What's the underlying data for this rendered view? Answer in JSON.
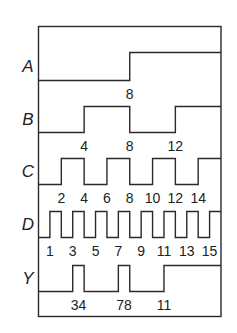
{
  "diagram": {
    "type": "timing-diagram",
    "time_range": [
      0,
      16
    ],
    "signals": [
      {
        "name": "A",
        "initial": 0,
        "transitions": [
          8
        ],
        "labels": [
          {
            "t": 8,
            "text": "8"
          }
        ]
      },
      {
        "name": "B",
        "initial": 0,
        "transitions": [
          4,
          8,
          12
        ],
        "labels": [
          {
            "t": 4,
            "text": "4"
          },
          {
            "t": 8,
            "text": "8"
          },
          {
            "t": 12,
            "text": "12"
          }
        ]
      },
      {
        "name": "C",
        "initial": 0,
        "transitions": [
          2,
          4,
          6,
          8,
          10,
          12,
          14
        ],
        "labels": [
          {
            "t": 2,
            "text": "2"
          },
          {
            "t": 4,
            "text": "4"
          },
          {
            "t": 6,
            "text": "6"
          },
          {
            "t": 8,
            "text": "8"
          },
          {
            "t": 10,
            "text": "10"
          },
          {
            "t": 12,
            "text": "12"
          },
          {
            "t": 14,
            "text": "14"
          }
        ]
      },
      {
        "name": "D",
        "initial": 0,
        "transitions": [
          1,
          2,
          3,
          4,
          5,
          6,
          7,
          8,
          9,
          10,
          11,
          12,
          13,
          14,
          15
        ],
        "labels": [
          {
            "t": 1,
            "text": "1"
          },
          {
            "t": 3,
            "text": "3"
          },
          {
            "t": 5,
            "text": "5"
          },
          {
            "t": 7,
            "text": "7"
          },
          {
            "t": 9,
            "text": "9"
          },
          {
            "t": 11,
            "text": "11"
          },
          {
            "t": 13,
            "text": "13"
          },
          {
            "t": 15,
            "text": "15"
          }
        ]
      },
      {
        "name": "Y",
        "initial": 0,
        "transitions": [
          3,
          4,
          7,
          8,
          11
        ],
        "labels": [
          {
            "t": 3.5,
            "text": "34"
          },
          {
            "t": 7.5,
            "text": "78"
          },
          {
            "t": 11,
            "text": "11"
          }
        ]
      }
    ]
  },
  "colors": {
    "line": "#2a2a2a",
    "text": "#222222",
    "background": "#ffffff"
  }
}
